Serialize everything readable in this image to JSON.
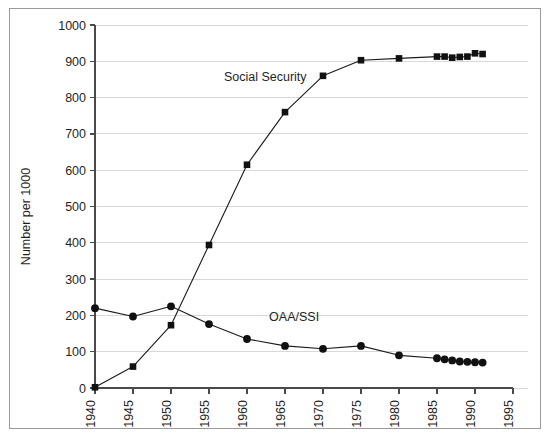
{
  "chart_data": {
    "type": "line",
    "title": "",
    "xlabel": "",
    "ylabel": "Number per 1000",
    "xlim": [
      1940,
      1995
    ],
    "ylim": [
      0,
      1000
    ],
    "grid": true,
    "legend_position": "inline-annotation",
    "x_ticks": [
      "1940",
      "1945",
      "1950",
      "1955",
      "1960",
      "1965",
      "1970",
      "1975",
      "1980",
      "1985",
      "1990",
      "1995"
    ],
    "y_ticks": [
      "0",
      "100",
      "200",
      "300",
      "400",
      "500",
      "600",
      "700",
      "800",
      "900",
      "1000"
    ],
    "series": [
      {
        "name": "Social Security",
        "marker": "square",
        "label_x": 1962.4,
        "label_y": 845,
        "points": [
          {
            "x": 1940,
            "y": 2
          },
          {
            "x": 1945,
            "y": 59
          },
          {
            "x": 1950,
            "y": 173
          },
          {
            "x": 1955,
            "y": 394
          },
          {
            "x": 1960,
            "y": 615
          },
          {
            "x": 1965,
            "y": 760
          },
          {
            "x": 1970,
            "y": 860
          },
          {
            "x": 1975,
            "y": 903
          },
          {
            "x": 1980,
            "y": 908
          },
          {
            "x": 1985,
            "y": 913
          },
          {
            "x": 1986,
            "y": 913
          },
          {
            "x": 1987,
            "y": 910
          },
          {
            "x": 1988,
            "y": 912
          },
          {
            "x": 1989,
            "y": 913
          },
          {
            "x": 1990,
            "y": 922
          },
          {
            "x": 1991,
            "y": 920
          }
        ]
      },
      {
        "name": "OAA/SSI",
        "marker": "circle",
        "label_x": 1966.2,
        "label_y": 185,
        "points": [
          {
            "x": 1940,
            "y": 220
          },
          {
            "x": 1945,
            "y": 197
          },
          {
            "x": 1950,
            "y": 225
          },
          {
            "x": 1955,
            "y": 176
          },
          {
            "x": 1960,
            "y": 135
          },
          {
            "x": 1965,
            "y": 116
          },
          {
            "x": 1970,
            "y": 108
          },
          {
            "x": 1975,
            "y": 116
          },
          {
            "x": 1980,
            "y": 90
          },
          {
            "x": 1985,
            "y": 82
          },
          {
            "x": 1986,
            "y": 79
          },
          {
            "x": 1987,
            "y": 76
          },
          {
            "x": 1988,
            "y": 73
          },
          {
            "x": 1989,
            "y": 72
          },
          {
            "x": 1990,
            "y": 71
          },
          {
            "x": 1991,
            "y": 70
          }
        ]
      }
    ]
  },
  "colors": {
    "series_line": "#1a1a1a",
    "marker": "#111111",
    "gridline": "#d8d8d8",
    "axis": "#4a4a4a",
    "frame": "#9a9a9a",
    "background": "#ffffff"
  }
}
